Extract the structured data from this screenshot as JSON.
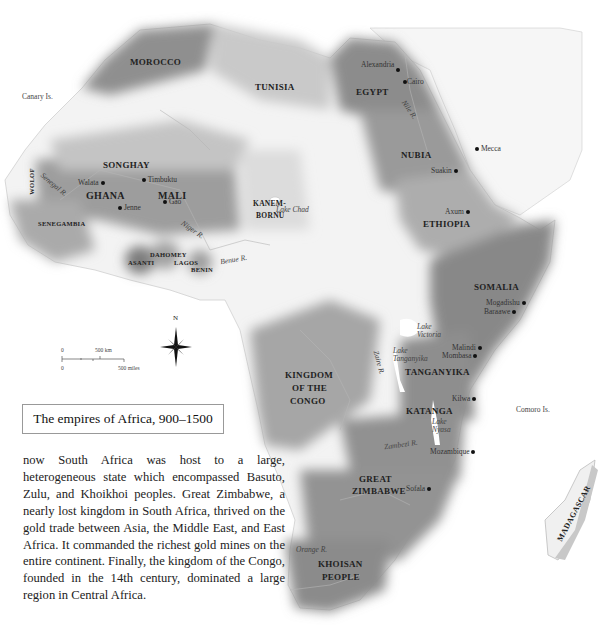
{
  "map": {
    "title": "The empires of Africa, 900–1500",
    "regions": [
      {
        "name": "MOROCCO"
      },
      {
        "name": "TUNISIA"
      },
      {
        "name": "EGYPT"
      },
      {
        "name": "NUBIA"
      },
      {
        "name": "ETHIOPIA"
      },
      {
        "name": "SOMALIA"
      },
      {
        "name": "SONGHAY"
      },
      {
        "name": "GHANA"
      },
      {
        "name": "MALI"
      },
      {
        "name": "WOLOF"
      },
      {
        "name": "SENEGAMBIA"
      },
      {
        "name": "KANEM-"
      },
      {
        "name": "BORNU"
      },
      {
        "name": "DAHOMEY"
      },
      {
        "name": "ASANTI"
      },
      {
        "name": "LAGOS"
      },
      {
        "name": "BENIN"
      },
      {
        "name": "KINGDOM"
      },
      {
        "name": "OF THE"
      },
      {
        "name": "CONGO"
      },
      {
        "name": "TANGANYIKA"
      },
      {
        "name": "KATANGA"
      },
      {
        "name": "GREAT"
      },
      {
        "name": "ZIMBABWE"
      },
      {
        "name": "KHOISAN"
      },
      {
        "name": "PEOPLE"
      },
      {
        "name": "MADAGASCAR"
      }
    ],
    "cities": [
      "Alexandria",
      "Cairo",
      "Mecca",
      "Suakin",
      "Axum",
      "Walata",
      "Timbuktu",
      "Gao",
      "Jenne",
      "Mogadishu",
      "Baraawe",
      "Malindi",
      "Mombasa",
      "Kilwa",
      "Mozambique",
      "Sofala"
    ],
    "features": [
      "Canary Is.",
      "Nile R.",
      "Senegal R.",
      "Niger R.",
      "Benue R.",
      "Lake Chad",
      "Lake Victoria",
      "Lake Tanganyika",
      "Zaire R.",
      "Lake Nyasa",
      "Zambezi R.",
      "Orange R.",
      "Comoro Is."
    ],
    "feature_lines": {
      "lake_victoria_1": "Lake",
      "lake_victoria_2": "Victoria",
      "lake_tang_1": "Lake",
      "lake_tang_2": "Tanganyika",
      "lake_nyasa_1": "Lake",
      "lake_nyasa_2": "Nyasa"
    },
    "compass": "N",
    "scale": {
      "km_zero": "0",
      "km_label": "500 km",
      "mi_zero": "0",
      "mi_label": "500 miles"
    },
    "colors": {
      "dark_shade": "#8f8f8f",
      "mid_shade": "#a8a8a8",
      "light_shade": "#c9c9c9",
      "land": "#f4f4f4",
      "rivers": "#b8b8b8"
    }
  },
  "body": {
    "paragraph": "now South Africa was host to a large, heterogeneous state which encompassed Basuto, Zulu, and Khoikhoi peoples. Great Zimbabwe, a nearly lost kingdom in South Africa, thrived on the gold trade between Asia, the Middle East, and East Africa. It commanded the richest gold mines on the entire continent. Finally, the kingdom of the Congo, founded in the 14th century, dominated a large region in Central Africa."
  }
}
